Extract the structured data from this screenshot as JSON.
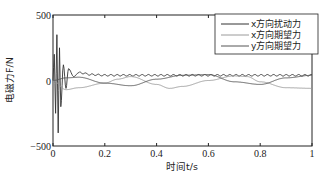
{
  "chart_data": {
    "type": "line",
    "title": "",
    "xlabel": "时间t/s",
    "ylabel": "电磁力F/N",
    "xlim": [
      0,
      1
    ],
    "ylim": [
      -500,
      500
    ],
    "xticks": [
      "0",
      "0.2",
      "0.4",
      "0.6",
      "0.8",
      "1"
    ],
    "yticks": [
      "-500",
      "0",
      "500"
    ],
    "grid": false,
    "legend_position": "upper right",
    "series": [
      {
        "name": "x方向扰动力",
        "color": "#333333",
        "description": "large damped oscillation at start (peaks ~+350/-400 N around t≈0.01-0.02), settles to ~+40 N with small high-frequency ripple",
        "x": [
          0,
          0.005,
          0.01,
          0.015,
          0.02,
          0.025,
          0.03,
          0.04,
          0.05,
          0.06,
          0.08,
          0.1,
          0.15,
          0.2,
          0.4,
          0.6,
          0.8,
          1.0
        ],
        "y": [
          0,
          200,
          -250,
          350,
          -400,
          250,
          -200,
          120,
          -60,
          90,
          30,
          60,
          45,
          40,
          40,
          40,
          40,
          40
        ]
      },
      {
        "name": "x方向期望力",
        "color": "#9a9a9a",
        "description": "starts oscillating, then a slow sinusoid of amplitude ~60 N with troughs near t≈0.05, 0.45, 0.9",
        "x": [
          0,
          0.05,
          0.1,
          0.2,
          0.25,
          0.3,
          0.4,
          0.45,
          0.5,
          0.6,
          0.7,
          0.75,
          0.8,
          0.9,
          1.0
        ],
        "y": [
          0,
          -70,
          -55,
          -20,
          10,
          30,
          -30,
          -60,
          -45,
          0,
          35,
          30,
          -10,
          -55,
          -60
        ]
      },
      {
        "name": "y方向期望力",
        "color": "#555555",
        "description": "slow sinusoid crossing the x-desired curve, peaks near t≈0.4 and t≈0.85",
        "x": [
          0,
          0.05,
          0.1,
          0.2,
          0.3,
          0.4,
          0.5,
          0.6,
          0.7,
          0.8,
          0.9,
          1.0
        ],
        "y": [
          0,
          20,
          25,
          -20,
          -40,
          10,
          40,
          45,
          -10,
          -30,
          20,
          40
        ]
      }
    ]
  }
}
